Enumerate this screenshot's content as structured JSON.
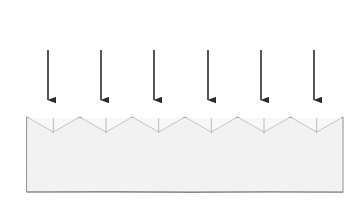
{
  "figure": {
    "type": "schematic-diagram",
    "style": "hand-drawn pencil sketch",
    "canvas": {
      "width": 361,
      "height": 213
    },
    "background_color": "#ffffff"
  },
  "colors": {
    "background": "#ffffff",
    "block_fill": "#f4f4f4",
    "block_outline": "#8f8f8f",
    "bottom_edge": "#8a8a8a",
    "arrow": "#2b2b2b",
    "notch_tick": "#a6a6a6"
  },
  "block": {
    "name": "serrated-block",
    "left_x": 27,
    "right_x": 343,
    "bottom_y": 192,
    "peak_y": 117,
    "valley_y": 132,
    "tooth_period": 52.7,
    "peak_count": 7,
    "valley_count": 6,
    "fill": "#f4f4f4",
    "outline": "#8f8f8f",
    "outline_width": 1,
    "peaks_x": [
      27,
      79.7,
      132.3,
      185,
      237.7,
      290.3,
      343
    ],
    "valleys_x": [
      53.3,
      106,
      158.7,
      211.3,
      264,
      316.7
    ]
  },
  "arrows": {
    "name": "incident-arrows",
    "count": 6,
    "color": "#2b2b2b",
    "shaft_width": 1.6,
    "head_width": 9,
    "head_length": 13,
    "top_y": 50,
    "tip_y": 108,
    "direction": "down",
    "items": [
      {
        "label": "arrow-1",
        "x": 48
      },
      {
        "label": "arrow-2",
        "x": 101
      },
      {
        "label": "arrow-3",
        "x": 154
      },
      {
        "label": "arrow-4",
        "x": 208
      },
      {
        "label": "arrow-5",
        "x": 261
      },
      {
        "label": "arrow-6",
        "x": 314
      }
    ]
  },
  "notch_ticks": {
    "name": "valley-tick-marks",
    "color": "#a6a6a6",
    "width": 1,
    "top_y": 118,
    "bottom_y": 133,
    "x_positions": [
      53.3,
      106,
      158.7,
      211.3,
      264,
      316.7
    ]
  },
  "captions": []
}
